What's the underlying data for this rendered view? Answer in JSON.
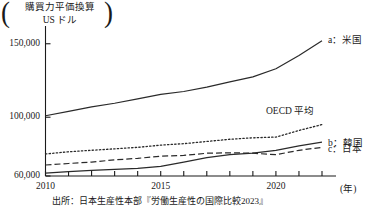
{
  "figure": {
    "unit_title_line1": "購買力平価換算",
    "unit_title_line2": "US ドル",
    "paren_left": "(",
    "paren_right": ")",
    "source_note": "出所：日本生産性本部『労働生産性の国際比較2023』"
  },
  "chart_data": {
    "type": "line",
    "title": "購買力平価換算 US ドル",
    "xlabel": "(年)",
    "ylabel": "購買力平価換算 US ドル",
    "xlim": [
      2010,
      2022
    ],
    "ylim": [
      60000,
      158000
    ],
    "grid": false,
    "legend_position": "right-inline",
    "yticks": [
      60000,
      100000,
      150000
    ],
    "ytick_labels": [
      "60,000",
      "100,000",
      "150,000"
    ],
    "xticks": [
      2010,
      2011,
      2012,
      2013,
      2014,
      2015,
      2016,
      2017,
      2018,
      2019,
      2020,
      2021,
      2022
    ],
    "xtick_labels": [
      {
        "value": 2010,
        "label": "2010"
      },
      {
        "value": 2015,
        "label": "2015"
      },
      {
        "value": 2020,
        "label": "2020"
      }
    ],
    "x": [
      2010,
      2011,
      2012,
      2013,
      2014,
      2015,
      2016,
      2017,
      2018,
      2019,
      2020,
      2021,
      2022
    ],
    "series": [
      {
        "name": "a：米国",
        "key": "usa",
        "style": "solid",
        "color": "#2a2a2a",
        "label": "a：米国",
        "values": [
          101000,
          104000,
          107000,
          109500,
          112500,
          115500,
          117500,
          120500,
          124000,
          127500,
          133000,
          142000,
          152000
        ]
      },
      {
        "name": "OECD 平均",
        "key": "oecd",
        "style": "dotted",
        "color": "#2a2a2a",
        "label": "OECD 平均",
        "values": [
          75000,
          76500,
          77500,
          78500,
          79500,
          81000,
          82000,
          83500,
          85000,
          86000,
          86500,
          91000,
          95000
        ]
      },
      {
        "name": "b：韓国",
        "key": "korea",
        "style": "solid",
        "color": "#2a2a2a",
        "label": "b：韓国",
        "values": [
          62000,
          63000,
          63800,
          64500,
          65200,
          66500,
          69500,
          72500,
          74500,
          75500,
          77500,
          80500,
          83000
        ]
      },
      {
        "name": "c：日本",
        "key": "japan",
        "style": "dashed",
        "color": "#2a2a2a",
        "label": "c：日本",
        "values": [
          67500,
          68500,
          69500,
          71000,
          72000,
          73500,
          74000,
          75500,
          75800,
          75500,
          74500,
          77500,
          79500
        ]
      }
    ]
  }
}
